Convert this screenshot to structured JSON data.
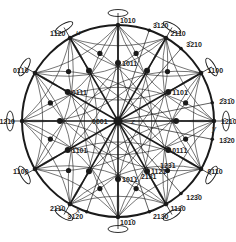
{
  "diagram": {
    "colors": {
      "line": "#1a1a1a",
      "background": "#ffffff"
    },
    "center_label": "0001",
    "axis_labels": {
      "u": "u",
      "x": "x",
      "y": "y",
      "z": "z"
    },
    "rim_poles": [
      {
        "label": "1̄010",
        "angle": 90,
        "major": true
      },
      {
        "label": "3̄120",
        "angle": 71,
        "major": false
      },
      {
        "label": "2̄110",
        "angle": 60,
        "major": true
      },
      {
        "label": "3̄210",
        "angle": 49,
        "major": false
      },
      {
        "label": "1̄100",
        "angle": 30,
        "major": true
      },
      {
        "label": "2̄31̄0",
        "angle": 11,
        "major": false
      },
      {
        "label": "1̄21̄0",
        "angle": 0,
        "major": true
      },
      {
        "label": "13̄20",
        "angle": -11,
        "major": false
      },
      {
        "label": "011̄0",
        "angle": -30,
        "major": true
      },
      {
        "label": "123̄0",
        "angle": -49,
        "major": false
      },
      {
        "label": "112̄0",
        "angle": -60,
        "major": true
      },
      {
        "label": "213̄0",
        "angle": -71,
        "major": false
      },
      {
        "label": "101̄0",
        "angle": -90,
        "major": true
      },
      {
        "label": "31̄20",
        "angle": -109,
        "major": false
      },
      {
        "label": "21̄1̄0",
        "angle": -120,
        "major": true
      },
      {
        "label": "1̄100",
        "angle": -150,
        "major": true
      },
      {
        "label": "12̄10",
        "angle": 180,
        "major": true
      },
      {
        "label": "01̄10",
        "angle": 150,
        "major": true
      },
      {
        "label": "1̄1̄20",
        "angle": 120,
        "major": true
      }
    ],
    "inner_poles": [
      {
        "label": "1̄011",
        "angle": 90
      },
      {
        "label": "1̄101",
        "angle": 30
      },
      {
        "label": "011̄1",
        "angle": -30
      },
      {
        "label": "112̄1",
        "angle": -60
      },
      {
        "label": "123̄1",
        "angle": -49
      },
      {
        "label": "21̄3̄1",
        "angle": -71
      },
      {
        "label": "101̄1",
        "angle": -90
      },
      {
        "label": "1̄101",
        "angle": -150
      },
      {
        "label": "01̄11",
        "angle": 150
      }
    ]
  }
}
